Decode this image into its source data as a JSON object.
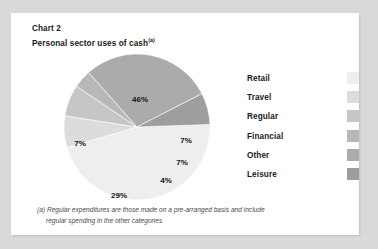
{
  "page": {
    "background_color": "#d9d9d9",
    "card_color": "#ffffff"
  },
  "header": {
    "chart_number": "Chart 2",
    "title": "Personal sector uses of cash",
    "title_superscript": "(a)"
  },
  "footnote": {
    "line1": "(a) Regular expenditures are those made on a pre-arranged basis and include",
    "line2": "regular spending in the other categories"
  },
  "legend": {
    "items": [
      {
        "label": "Retail",
        "color": "#eeeeee"
      },
      {
        "label": "Travel",
        "color": "#dcdcdc"
      },
      {
        "label": "Regular",
        "color": "#c6c6c6"
      },
      {
        "label": "Financial",
        "color": "#b8b8b8"
      },
      {
        "label": "Other",
        "color": "#ababab"
      },
      {
        "label": "Leisure",
        "color": "#9e9e9e"
      }
    ]
  },
  "chart_data": {
    "type": "pie",
    "title": "Personal sector uses of cash",
    "categories": [
      "Retail",
      "Travel",
      "Regular",
      "Financial",
      "Other",
      "Leisure"
    ],
    "values": [
      46,
      7,
      7,
      4,
      29,
      7
    ],
    "unit": "%",
    "data_labels": [
      "46%",
      "7%",
      "7%",
      "4%",
      "29%",
      "7%"
    ],
    "colors": [
      "#eeeeee",
      "#dcdcdc",
      "#c6c6c6",
      "#b8b8b8",
      "#ababab",
      "#9e9e9e"
    ],
    "legend_position": "right",
    "grid": false,
    "xlabel": "",
    "ylabel": "",
    "start_angle_deg": 88,
    "direction": "clockwise",
    "label_positions": [
      {
        "label": "46%",
        "x": 82,
        "y": 48
      },
      {
        "label": "7%",
        "x": 128,
        "y": 89
      },
      {
        "label": "7%",
        "x": 124,
        "y": 111
      },
      {
        "label": "4%",
        "x": 108,
        "y": 129
      },
      {
        "label": "29%",
        "x": 61,
        "y": 144
      },
      {
        "label": "7%",
        "x": 22,
        "y": 92
      }
    ]
  }
}
